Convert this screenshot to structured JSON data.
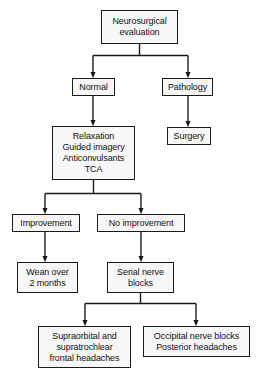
{
  "diagram": {
    "type": "flowchart",
    "background_color": "#ffffff",
    "box_fill_color": "#f7f7f7",
    "box_border_color": "#1a1a1a",
    "connector_color": "#1a1a1a",
    "nodes": [
      {
        "id": "neurosurgical-evaluation",
        "label": "Neurosurgical\nevaluation",
        "x": 101,
        "y": 10,
        "w": 77,
        "h": 34
      },
      {
        "id": "normal",
        "label": "Normal",
        "x": 72,
        "y": 78,
        "w": 43,
        "h": 18
      },
      {
        "id": "pathology",
        "label": "Pathology",
        "x": 162,
        "y": 78,
        "w": 51,
        "h": 18
      },
      {
        "id": "conservative-therapy",
        "label": "Relaxation\nGuided imagery\nAnticonvulsants\nTCA",
        "x": 52,
        "y": 126,
        "w": 83,
        "h": 54
      },
      {
        "id": "surgery",
        "label": "Surgery",
        "x": 167,
        "y": 127,
        "w": 44,
        "h": 18
      },
      {
        "id": "improvement",
        "label": "Improvement",
        "x": 12,
        "y": 214,
        "w": 68,
        "h": 18
      },
      {
        "id": "no-improvement",
        "label": "No improvement",
        "x": 97,
        "y": 214,
        "w": 88,
        "h": 18
      },
      {
        "id": "wean-over-2-months",
        "label": "Wean over\n2 months",
        "x": 17,
        "y": 262,
        "w": 61,
        "h": 31
      },
      {
        "id": "serial-nerve-blocks",
        "label": "Serial nerve\nblocks",
        "x": 107,
        "y": 262,
        "w": 67,
        "h": 31
      },
      {
        "id": "supraorbital-supratrochlear",
        "label": "Supraorbital and\nsupratrochlear\nfrontal headaches",
        "x": 38,
        "y": 326,
        "w": 93,
        "h": 42
      },
      {
        "id": "occipital-nerve-blocks",
        "label": "Occipital nerve blocks\nPosterior headaches",
        "x": 143,
        "y": 326,
        "w": 107,
        "h": 31
      }
    ],
    "edges": [
      {
        "from": "neurosurgical-evaluation",
        "to": "normal",
        "style": "split-left"
      },
      {
        "from": "neurosurgical-evaluation",
        "to": "pathology",
        "style": "split-right"
      },
      {
        "from": "normal",
        "to": "conservative-therapy",
        "style": "straight"
      },
      {
        "from": "pathology",
        "to": "surgery",
        "style": "straight"
      },
      {
        "from": "conservative-therapy",
        "to": "improvement",
        "style": "split-left"
      },
      {
        "from": "conservative-therapy",
        "to": "no-improvement",
        "style": "split-right"
      },
      {
        "from": "improvement",
        "to": "wean-over-2-months",
        "style": "straight"
      },
      {
        "from": "no-improvement",
        "to": "serial-nerve-blocks",
        "style": "straight"
      },
      {
        "from": "serial-nerve-blocks",
        "to": "supraorbital-supratrochlear",
        "style": "split-left"
      },
      {
        "from": "serial-nerve-blocks",
        "to": "occipital-nerve-blocks",
        "style": "split-right"
      }
    ]
  }
}
